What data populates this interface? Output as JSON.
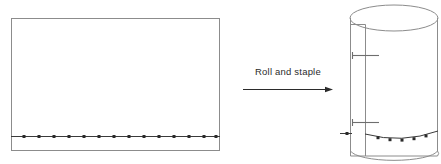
{
  "figure": {
    "background_color": "#ffffff",
    "width": 441,
    "height": 164,
    "caption": {
      "text": "Roll and staple",
      "x": 288,
      "y": 75,
      "font_size": 9.5,
      "color": "#2b2b2b"
    },
    "arrow": {
      "name": "process-arrow",
      "x1": 243,
      "y1": 89,
      "x2": 333,
      "y2": 89,
      "color": "#2b2b2b",
      "head_length": 8,
      "head_width": 5
    },
    "left_panel": {
      "name": "flat-sheet",
      "shape": "rectangle",
      "x": 11,
      "y": 18,
      "width": 209,
      "height": 133,
      "stroke_color": "#8c8c8c",
      "stroke_width": 1,
      "fill": "none",
      "pin_line": {
        "name": "pin-row",
        "y": 136,
        "x_start": 11,
        "x_end": 220,
        "stroke_color": "#3a3a3a",
        "dot_color": "#2b2b2b",
        "dot_size": 3,
        "dot_count": 14,
        "dot_x_positions": [
          24,
          39,
          54,
          69,
          84,
          99,
          114,
          129,
          144,
          159,
          174,
          189,
          204,
          216
        ]
      }
    },
    "right_panel": {
      "name": "rolled-cylinder",
      "shape": "cylinder",
      "center_x": 394,
      "top_ellipse": {
        "cx": 394,
        "cy": 18,
        "rx": 44,
        "ry": 13,
        "stroke_color": "#8c8c8c"
      },
      "bottom_arc": {
        "cx": 394,
        "cy": 151,
        "rx": 44,
        "ry": 11,
        "stroke_color": "#8c8c8c"
      },
      "body_left_x": 350,
      "body_right_x": 438,
      "body_top_y": 18,
      "body_bottom_y": 151,
      "stroke_color": "#8c8c8c",
      "overlap_flap": {
        "name": "seam-flap",
        "x_outer": 350,
        "x_inner": 365,
        "top_y": 24,
        "bottom_y": 156,
        "stroke_color": "#8c8c8c"
      },
      "staples": [
        {
          "name": "staple-upper",
          "x_start": 352,
          "x_end": 379,
          "y": 55,
          "color": "#6e6e6e"
        },
        {
          "name": "staple-lower",
          "x_start": 352,
          "x_end": 379,
          "y": 122,
          "color": "#6e6e6e"
        }
      ],
      "pin_arc": {
        "name": "cylinder-pin-row",
        "x_start": 365,
        "x_end": 438,
        "y_base": 137,
        "sag": 5,
        "stroke_color": "#3a3a3a",
        "dot_color": "#2b2b2b",
        "dot_size": 3,
        "dot_count": 5,
        "dot_x_positions": [
          378,
          390,
          402,
          414,
          426
        ]
      },
      "side_pin_stub": {
        "name": "side-pin-stub",
        "x_start": 340,
        "x_end": 352,
        "y": 133,
        "dot_x": 347,
        "stroke_color": "#3a3a3a"
      }
    }
  }
}
